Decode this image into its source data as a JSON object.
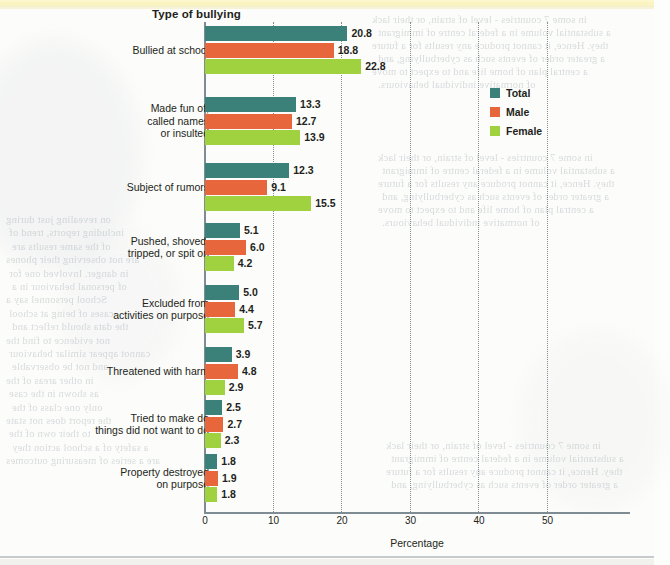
{
  "chart_data": {
    "type": "bar",
    "orientation": "horizontal",
    "title": "Type of bullying",
    "xlabel": "Percentage",
    "ylabel": "Type of bullying",
    "xlim": [
      0,
      50
    ],
    "xticks": [
      0,
      10,
      20,
      30,
      40,
      50
    ],
    "grid": "vertical dotted gridlines at each tick",
    "legend_position": "upper right inside plot",
    "categories": [
      "Bullied at school",
      "Made fun of,\ncalled names\nor insulted",
      "Subject of rumors",
      "Pushed, shoved,\ntripped, or spit on",
      "Excluded from\nactivities on purpose",
      "Threatened with harm",
      "Tried to make do\nthings did not want to do",
      "Property destroyed\non purpose"
    ],
    "series": [
      {
        "name": "Total",
        "color": "#3b817a",
        "values": [
          20.8,
          13.3,
          12.3,
          5.1,
          5.0,
          3.9,
          2.5,
          1.8
        ]
      },
      {
        "name": "Male",
        "color": "#e8663c",
        "values": [
          18.8,
          12.7,
          9.1,
          6.0,
          4.4,
          4.8,
          2.7,
          1.9
        ]
      },
      {
        "name": "Female",
        "color": "#a0d23f",
        "values": [
          22.8,
          13.9,
          15.5,
          4.2,
          5.7,
          2.9,
          2.3,
          1.8
        ]
      }
    ]
  },
  "categories_display": [
    [
      "Bullied at school"
    ],
    [
      "Made fun of,",
      "called names",
      "or insulted"
    ],
    [
      "Subject of rumors"
    ],
    [
      "Pushed, shoved,",
      "tripped, or spit on"
    ],
    [
      "Excluded from",
      "activities on purpose"
    ],
    [
      "Threatened with harm"
    ],
    [
      "Tried to make do",
      "things did not want to do"
    ],
    [
      "Property destroyed",
      "on purpose"
    ]
  ],
  "axis": {
    "title": "Type of bullying",
    "x_caption": "Percentage",
    "x_ticks": [
      "0",
      "10",
      "20",
      "30",
      "40",
      "50"
    ]
  },
  "legend": {
    "items": [
      {
        "label": "Total",
        "color": "#3b817a"
      },
      {
        "label": "Male",
        "color": "#e8663c"
      },
      {
        "label": "Female",
        "color": "#a0d23f"
      }
    ]
  },
  "values_text": {
    "g0": [
      "20.8",
      "18.8",
      "22.8"
    ],
    "g1": [
      "13.3",
      "12.7",
      "13.9"
    ],
    "g2": [
      "12.3",
      "9.1",
      "15.5"
    ],
    "g3": [
      "5.1",
      "6.0",
      "4.2"
    ],
    "g4": [
      "5.0",
      "4.4",
      "5.7"
    ],
    "g5": [
      "3.9",
      "4.8",
      "2.9"
    ],
    "g6": [
      "2.5",
      "2.7",
      "2.3"
    ],
    "g7": [
      "1.8",
      "1.9",
      "1.8"
    ]
  },
  "ghost_text": {
    "right_col": [
      "in some 7 countries - level of strain, or their lack",
      "a substantial volume in a federal centre of immigrant",
      "they. Hence, it cannot produce any results for a future",
      "a greater order of events such as cyberbullying, and",
      "a central plan of home life and to expect to move",
      "of normative individual behaviours."
    ],
    "left_col": [
      "on revealing just during",
      "including reports, trend of",
      "of the same results are",
      "are not observing their phones",
      "in danger. Involved one for",
      "of personal behaviour in a",
      "School personnel say a",
      "cases of being at school",
      "the data should reflect and",
      "not evidence to find the",
      "cannot appear similar behaviour",
      "and not be observable",
      "in other areas of the",
      "as shown in the case",
      "only one class of the",
      "the report does not state",
      "to their own of the",
      "a safety of a school action they",
      "are a series of measuring outcomes"
    ]
  }
}
